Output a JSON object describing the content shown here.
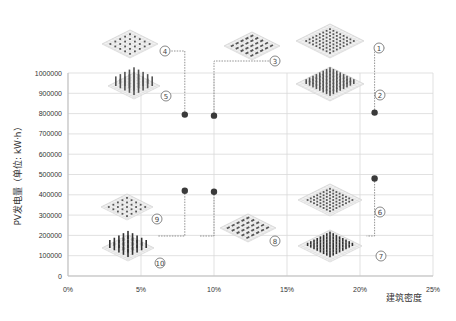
{
  "chart_data": {
    "type": "scatter",
    "title": "",
    "xlabel": "建筑密度",
    "ylabel": "PV发电量（单位: kW·h）",
    "xlim": [
      0,
      25
    ],
    "ylim": [
      0,
      1000000
    ],
    "x_ticks": [
      "0%",
      "5%",
      "10%",
      "15%",
      "20%",
      "25%"
    ],
    "y_ticks": [
      "0",
      "100000",
      "200000",
      "300000",
      "400000",
      "500000",
      "600000",
      "700000",
      "800000",
      "900000",
      "1000000"
    ],
    "grid": true,
    "legend": "none",
    "series": [
      {
        "name": "high-rise configurations",
        "points": [
          {
            "x": 8,
            "y": 795000,
            "labels": [
              "4",
              "5"
            ]
          },
          {
            "x": 10,
            "y": 790000,
            "labels": [
              "3"
            ]
          },
          {
            "x": 21,
            "y": 805000,
            "labels": [
              "1",
              "2"
            ]
          }
        ]
      },
      {
        "name": "low-rise configurations",
        "points": [
          {
            "x": 8,
            "y": 420000,
            "labels": [
              "9",
              "10"
            ]
          },
          {
            "x": 10,
            "y": 415000,
            "labels": [
              "8"
            ]
          },
          {
            "x": 21,
            "y": 480000,
            "labels": [
              "6",
              "7"
            ]
          }
        ]
      }
    ],
    "annotations": [
      {
        "id": "1",
        "text": "①",
        "desc": "dense grid layout, medium height"
      },
      {
        "id": "2",
        "text": "②",
        "desc": "dense grid layout, tall"
      },
      {
        "id": "3",
        "text": "③",
        "desc": "row layout"
      },
      {
        "id": "4",
        "text": "④",
        "desc": "sparse point layout, short"
      },
      {
        "id": "5",
        "text": "⑤",
        "desc": "sparse point layout, tall"
      },
      {
        "id": "6",
        "text": "⑥",
        "desc": "dense grid layout, low"
      },
      {
        "id": "7",
        "text": "⑦",
        "desc": "dense grid layout, low, darker"
      },
      {
        "id": "8",
        "text": "⑧",
        "desc": "row layout, low"
      },
      {
        "id": "9",
        "text": "⑨",
        "desc": "sparse point layout, low"
      },
      {
        "id": "10",
        "text": "⑩",
        "desc": "sparse point layout, medium"
      }
    ]
  }
}
